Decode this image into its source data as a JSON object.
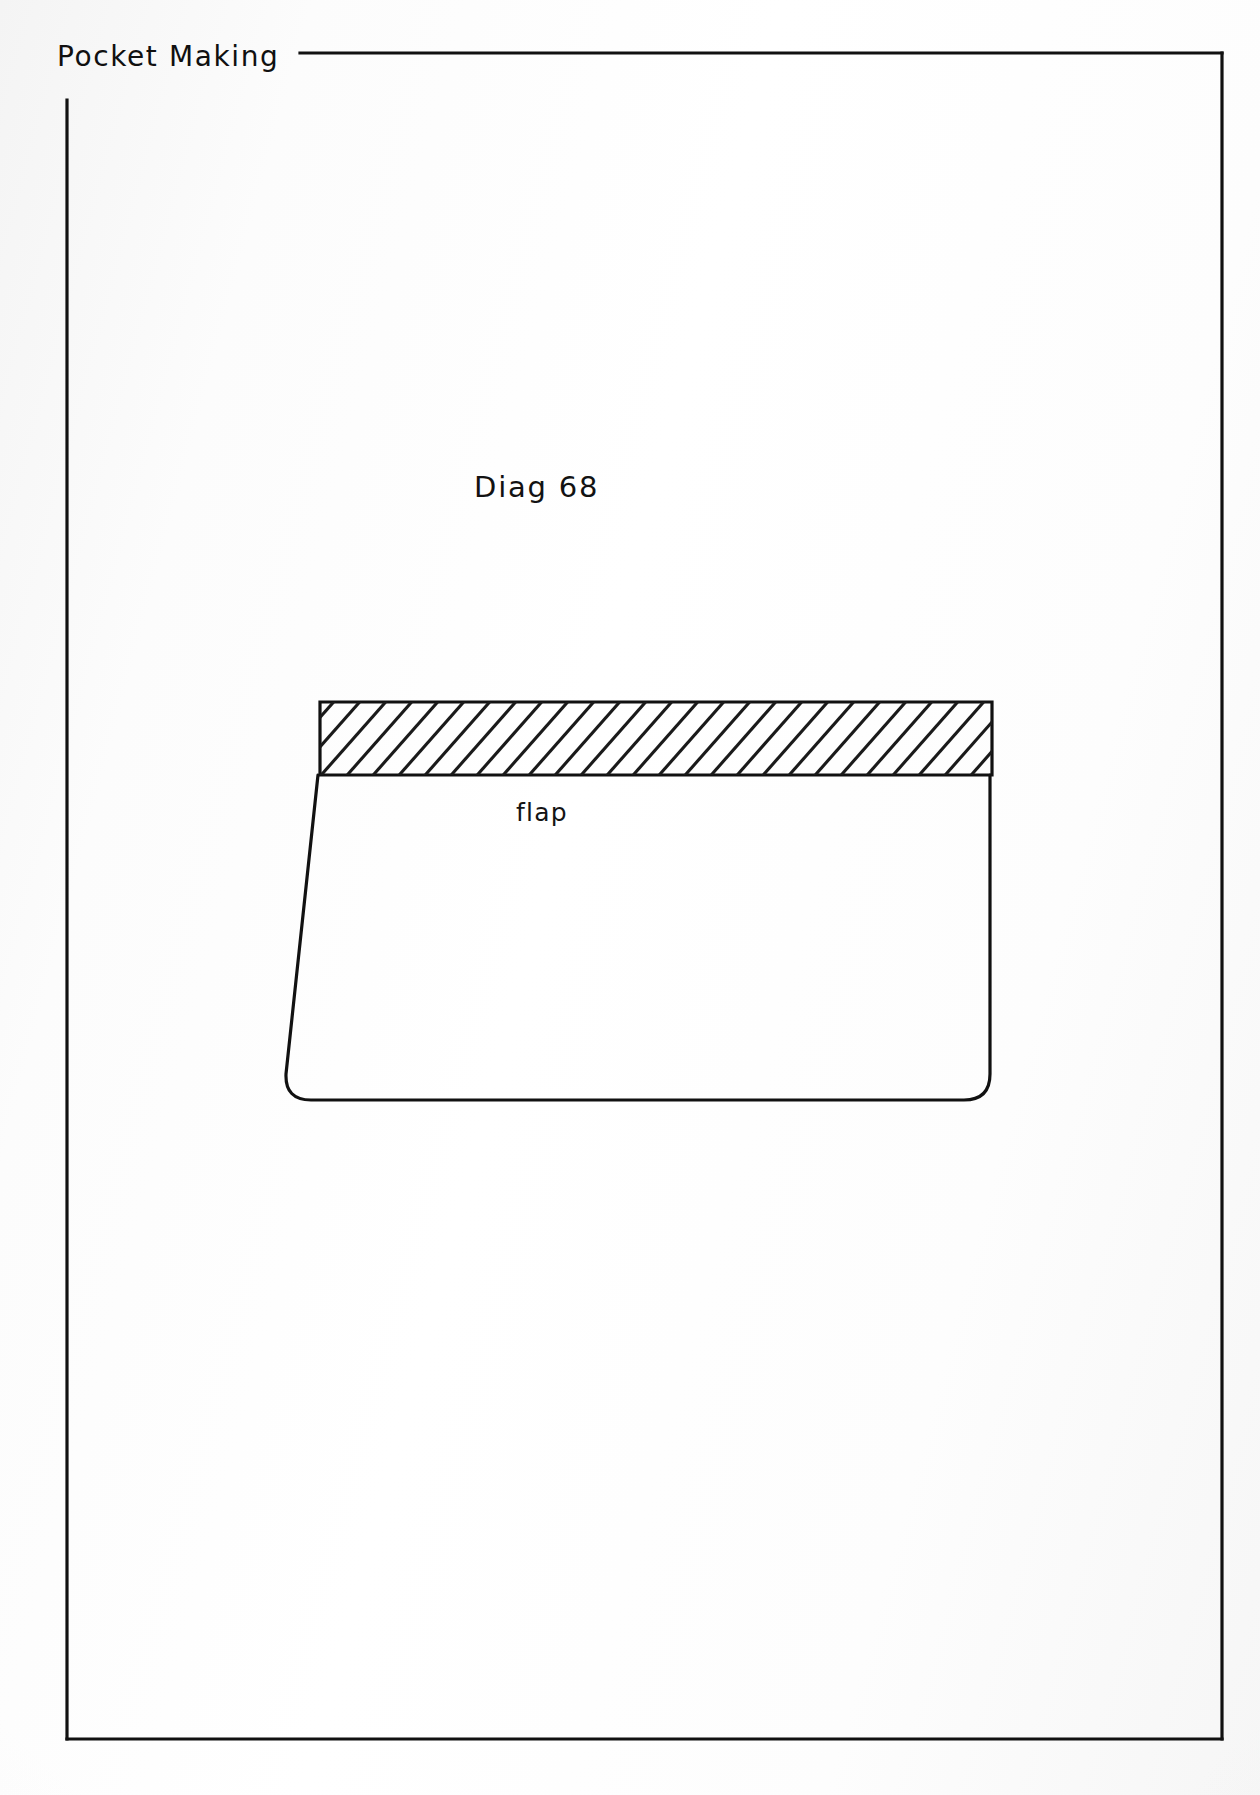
{
  "page": {
    "width": 1260,
    "height": 1795,
    "background_color": "#fdfdfd",
    "ink_color": "#111111"
  },
  "header": {
    "title": "Pocket Making",
    "rule_label": "header-rule"
  },
  "frame": {
    "name": "page-border",
    "top_y": 53,
    "left_x": 67,
    "right_x": 1222,
    "bottom_y": 1739,
    "top_rule_start_x": 340,
    "left_rule_start_y": 100,
    "stroke_width": 3
  },
  "diagram": {
    "title": "Diag 68",
    "caption_label": "flap",
    "type": "technical-sewing-pattern",
    "shape": {
      "name": "pocket-flap-outline",
      "hatched_band": {
        "label": "seam-allowance-hatched-band",
        "left_x": 320,
        "right_x": 992,
        "top_y": 702,
        "bottom_y": 775,
        "hatch_angle_deg": 50,
        "hatch_spacing_px": 26,
        "hatch_stroke_width": 3
      },
      "body": {
        "label": "flap-body",
        "top_left_x": 318,
        "top_right_x": 992,
        "top_y": 775,
        "bottom_left_x": 285,
        "bottom_right_x": 990,
        "bottom_y": 1100,
        "corner_radius": 26
      }
    }
  },
  "colors": {
    "ink": "#111111",
    "paper": "#fdfdfd",
    "hatch": "#1a1a1a"
  }
}
